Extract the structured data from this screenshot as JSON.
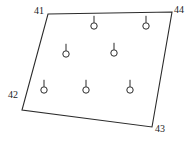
{
  "figure": {
    "type": "survey-plot-diagram",
    "background_color": "#ffffff",
    "stroke_color": "#2b2b2b",
    "text_color": "#1c1c1c",
    "width": 191,
    "height": 143
  },
  "boundary": {
    "name": "quadrilateral-boundary",
    "closed": true,
    "stroke_width": 1.1,
    "vertices": [
      {
        "id": "41",
        "x": 48,
        "y": 14
      },
      {
        "id": "44",
        "x": 172,
        "y": 12
      },
      {
        "id": "43",
        "x": 152,
        "y": 127
      },
      {
        "id": "42",
        "x": 22,
        "y": 110
      }
    ],
    "path_points": "48,14 172,12 152,127 22,110"
  },
  "corner_labels": [
    {
      "id": "label-41",
      "text": "41",
      "x": 34,
      "y": 6,
      "anchor": "corner-41"
    },
    {
      "id": "label-44",
      "text": "44",
      "x": 174,
      "y": 5,
      "anchor": "corner-44"
    },
    {
      "id": "label-42",
      "text": "42",
      "x": 8,
      "y": 90,
      "anchor": "corner-42"
    },
    {
      "id": "label-43",
      "text": "43",
      "x": 155,
      "y": 124,
      "anchor": "corner-43"
    }
  ],
  "markers": {
    "symbol": "circle-with-stem",
    "circle_radius": 3.2,
    "stem_length": 7,
    "stroke_width": 1.0,
    "count": 7,
    "points": [
      {
        "id": "marker-1",
        "x": 94,
        "y": 26,
        "row": "top"
      },
      {
        "id": "marker-2",
        "x": 146,
        "y": 26,
        "row": "top"
      },
      {
        "id": "marker-3",
        "x": 66,
        "y": 54,
        "row": "middle"
      },
      {
        "id": "marker-4",
        "x": 114,
        "y": 53,
        "row": "middle"
      },
      {
        "id": "marker-5",
        "x": 44,
        "y": 90,
        "row": "bottom"
      },
      {
        "id": "marker-6",
        "x": 86,
        "y": 90,
        "row": "bottom"
      },
      {
        "id": "marker-7",
        "x": 130,
        "y": 90,
        "row": "bottom"
      }
    ]
  }
}
